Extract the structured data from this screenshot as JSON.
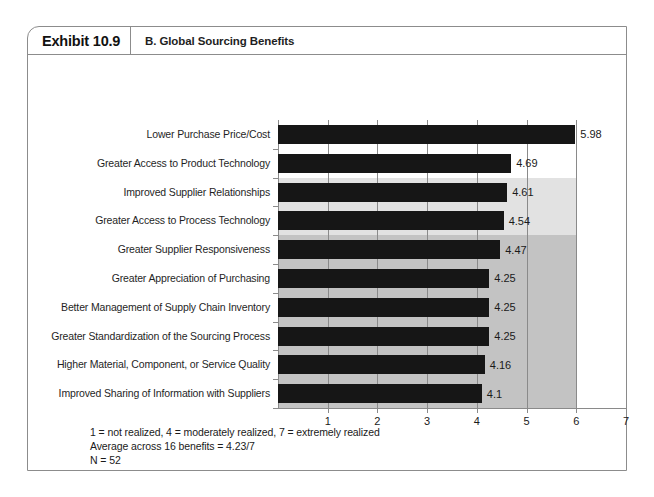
{
  "exhibit": {
    "number": "Exhibit 10.9",
    "title": "B. Global Sourcing Benefits"
  },
  "footnote": {
    "line1": "1 = not realized, 4 = moderately realized, 7 = extremely realized",
    "line2": "Average across 16 benefits = 4.23/7",
    "line3": "N = 52"
  },
  "colors": {
    "bar": "#161616",
    "band_light": "#e2e2e2",
    "band_medium": "#c3c3c3",
    "axis": "#8a8a8a",
    "card_border": "#8c8c8c"
  },
  "chart_data": {
    "type": "bar",
    "orientation": "horizontal",
    "title": "B. Global Sourcing Benefits",
    "xlabel": "",
    "ylabel": "",
    "xlim": [
      0,
      7
    ],
    "xticks": [
      1,
      2,
      3,
      4,
      5,
      6,
      7
    ],
    "xtick_labels": [
      "1",
      "2",
      "3",
      "4",
      "5",
      "6",
      "7"
    ],
    "grid": true,
    "legend": null,
    "categories": [
      "Lower Purchase Price/Cost",
      "Greater Access to Product Technology",
      "Improved Supplier Relationships",
      "Greater Access to Process Technology",
      "Greater Supplier Responsiveness",
      "Greater Appreciation of Purchasing",
      "Better Management of Supply Chain Inventory",
      "Greater Standardization of the Sourcing Process",
      "Higher Material, Component, or Service Quality",
      "Improved Sharing of Information with Suppliers"
    ],
    "values": [
      5.98,
      4.69,
      4.61,
      4.54,
      4.47,
      4.25,
      4.25,
      4.25,
      4.16,
      4.1
    ],
    "value_labels": [
      "5.98",
      "4.69",
      "4.61",
      "4.54",
      "4.47",
      "4.25",
      "4.25",
      "4.25",
      "4.16",
      "4.1"
    ],
    "shaded_bands": [
      {
        "name": "light-band",
        "from_row": 2,
        "to_row": 3,
        "x_end": 6,
        "color": "#e2e2e2"
      },
      {
        "name": "medium-band",
        "from_row": 4,
        "to_row": 9,
        "x_end": 6,
        "color": "#c3c3c3"
      }
    ],
    "annotations": [
      "1 = not realized, 4 = moderately realized, 7 = extremely realized",
      "Average across 16 benefits = 4.23/7",
      "N = 52"
    ]
  }
}
